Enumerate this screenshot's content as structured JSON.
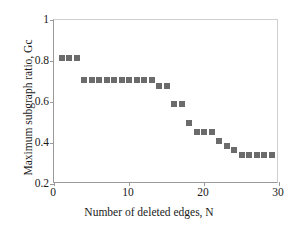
{
  "chart_data": {
    "type": "scatter",
    "title": "",
    "xlabel": "Number of deleted edges, N",
    "ylabel": "Maximum subgraph ratio, Gc",
    "xlim": [
      0,
      30
    ],
    "ylim": [
      0.2,
      1.0
    ],
    "xticks": [
      0,
      10,
      20,
      30
    ],
    "yticks": [
      0.2,
      0.4,
      0.6,
      0.8,
      1
    ],
    "xtick_labels": [
      "0",
      "10",
      "20",
      "30"
    ],
    "ytick_labels": [
      "0.2",
      "0.4",
      "0.6",
      "0.8",
      "1"
    ],
    "grid": false,
    "legend": null,
    "marker": {
      "shape": "square",
      "color": "#6b6b6b",
      "size_px": 6
    },
    "x": [
      1,
      2,
      3,
      4,
      5,
      6,
      7,
      8,
      9,
      10,
      11,
      12,
      13,
      14,
      15,
      16,
      17,
      18,
      19,
      20,
      21,
      22,
      23,
      24,
      25,
      26,
      27,
      28,
      29
    ],
    "values": [
      0.815,
      0.815,
      0.815,
      0.705,
      0.705,
      0.705,
      0.705,
      0.705,
      0.705,
      0.705,
      0.705,
      0.705,
      0.705,
      0.68,
      0.68,
      0.59,
      0.59,
      0.5,
      0.455,
      0.455,
      0.455,
      0.41,
      0.385,
      0.365,
      0.34,
      0.34,
      0.34,
      0.34,
      0.34
    ]
  },
  "axes": {
    "x_title": "Number of deleted edges, N",
    "y_title": "Maximum subgraph ratio, Gc"
  }
}
